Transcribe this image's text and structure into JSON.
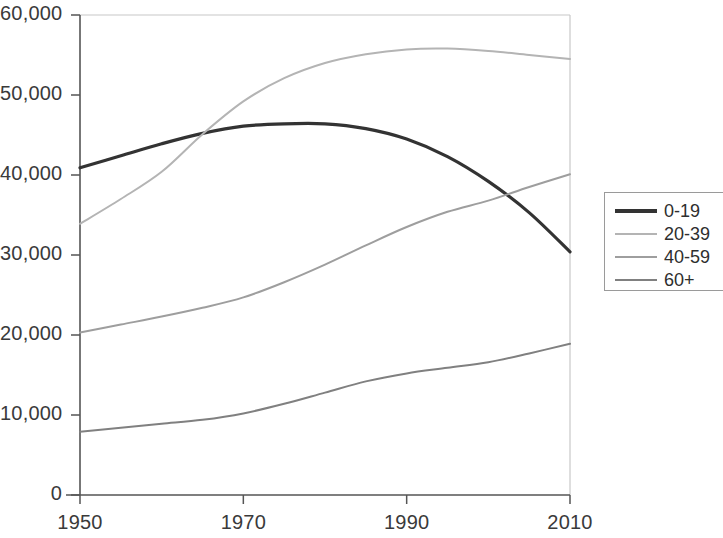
{
  "chart_data": {
    "type": "line",
    "title": "",
    "xlabel": "",
    "ylabel": "",
    "xlim": [
      1950,
      2010
    ],
    "ylim": [
      0,
      60000
    ],
    "grid": false,
    "legend_position": "right",
    "x_ticks": [
      "1950",
      "1970",
      "1990",
      "2010"
    ],
    "x_tick_values": [
      1950,
      1970,
      1990,
      2010
    ],
    "y_ticks": [
      "0",
      "10,000",
      "20,000",
      "30,000",
      "40,000",
      "50,000",
      "60,000"
    ],
    "y_tick_values": [
      0,
      10000,
      20000,
      30000,
      40000,
      50000,
      60000
    ],
    "x": [
      1950,
      1955,
      1960,
      1965,
      1970,
      1975,
      1980,
      1985,
      1990,
      1995,
      2000,
      2005,
      2010
    ],
    "series": [
      {
        "name": "0-19",
        "color": "#333333",
        "width": 3.2,
        "values": [
          40900,
          42400,
          43900,
          45200,
          46100,
          46400,
          46400,
          45800,
          44500,
          42300,
          39200,
          35300,
          30400
        ]
      },
      {
        "name": "20-39",
        "color": "#b4b4b4",
        "width": 2.0,
        "values": [
          33900,
          37000,
          40400,
          45100,
          49200,
          52100,
          54000,
          55100,
          55700,
          55800,
          55500,
          55000,
          54500
        ]
      },
      {
        "name": "40-59",
        "color": "#9e9e9e",
        "width": 2.0,
        "values": [
          20300,
          21300,
          22300,
          23400,
          24700,
          26600,
          28800,
          31200,
          33500,
          35400,
          36800,
          38500,
          40100
        ]
      },
      {
        "name": "60+",
        "color": "#808080",
        "width": 2.0,
        "values": [
          7900,
          8400,
          8900,
          9400,
          10200,
          11400,
          12800,
          14200,
          15200,
          15900,
          16600,
          17700,
          18900
        ]
      }
    ]
  },
  "axes": {
    "axis_color": "#555555",
    "frame_color": "#c8c8c8"
  },
  "legend": {
    "entries": [
      {
        "label": "0-19"
      },
      {
        "label": "20-39"
      },
      {
        "label": "40-59"
      },
      {
        "label": "60+"
      }
    ]
  }
}
